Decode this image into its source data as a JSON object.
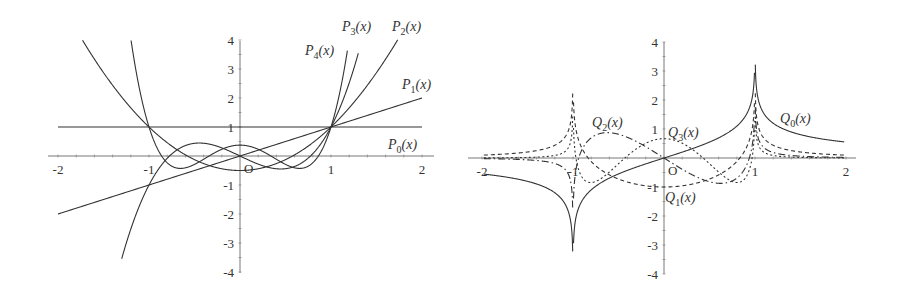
{
  "chart_data": [
    {
      "type": "line",
      "title": "",
      "xlabel": "",
      "ylabel": "",
      "xlim": [
        -2,
        2
      ],
      "ylim": [
        -4,
        4
      ],
      "grid": false,
      "origin_label": "O",
      "x_ticks": [
        "-2",
        "-1",
        "1",
        "2"
      ],
      "y_ticks": [
        "4",
        "3",
        "2",
        "1",
        "-1",
        "-2",
        "-3",
        "-4"
      ],
      "series": [
        {
          "name": "P_0(x)",
          "label_main": "P",
          "label_sub": "0",
          "formula": "1",
          "style": "solid"
        },
        {
          "name": "P_1(x)",
          "label_main": "P",
          "label_sub": "1",
          "formula": "x",
          "style": "solid"
        },
        {
          "name": "P_2(x)",
          "label_main": "P",
          "label_sub": "2",
          "formula": "(3x^2-1)/2",
          "style": "solid"
        },
        {
          "name": "P_3(x)",
          "label_main": "P",
          "label_sub": "3",
          "formula": "(5x^3-3x)/2",
          "style": "solid"
        },
        {
          "name": "P_4(x)",
          "label_main": "P",
          "label_sub": "4",
          "formula": "(35x^4-30x^2+3)/8",
          "style": "solid"
        }
      ],
      "key_points": [
        {
          "x": 1,
          "y": 1,
          "note": "all P_n pass through (1,1)"
        },
        {
          "x": -1,
          "y": 1,
          "note": "even P_n pass through (-1,1)"
        },
        {
          "x": -1,
          "y": -1,
          "note": "odd P_n pass through (-1,-1)"
        }
      ]
    },
    {
      "type": "line",
      "title": "",
      "xlabel": "",
      "ylabel": "",
      "xlim": [
        -2,
        2
      ],
      "ylim": [
        -4,
        4
      ],
      "grid": false,
      "origin_label": "O",
      "x_ticks": [
        "-2",
        "-1",
        "1",
        "2"
      ],
      "y_ticks": [
        "4",
        "3",
        "2",
        "1",
        "-1",
        "-2",
        "-3",
        "-4"
      ],
      "series": [
        {
          "name": "Q_0(x)",
          "label_main": "Q",
          "label_sub": "0",
          "formula": "(1/2)ln|(1+x)/(1-x)|",
          "style": "solid"
        },
        {
          "name": "Q_1(x)",
          "label_main": "Q",
          "label_sub": "1",
          "formula": "x*Q_0(x) - 1",
          "style": "dashed"
        },
        {
          "name": "Q_2(x)",
          "label_main": "Q",
          "label_sub": "2",
          "formula": "P_2(x)Q_0(x) - 3x/2",
          "style": "dash-dot"
        },
        {
          "name": "Q_3(x)",
          "label_main": "Q",
          "label_sub": "3",
          "formula": "P_3(x)Q_0(x) - 5x^2/2 + 2/3",
          "style": "dotted"
        }
      ],
      "annotations": [
        "singularities at x = -1 and x = 1"
      ]
    }
  ]
}
